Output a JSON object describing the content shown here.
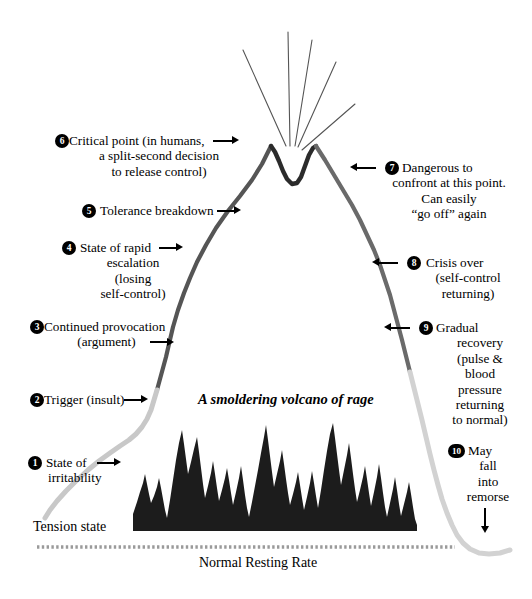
{
  "diagram": {
    "title_partial": "",
    "center_caption": "A smoldering volcano of rage",
    "baseline_label": "Normal Resting Rate",
    "tension_label": "Tension state",
    "colors": {
      "slope_upper": "#555555",
      "slope_lower": "#c8c8c8",
      "lava": "#1c1c1c",
      "baseline": "#9a9a9a",
      "eruption": "#555555",
      "text": "#000000",
      "badge": "#000000"
    },
    "stages": [
      {
        "number": "1",
        "side": "left",
        "lines": [
          "State of",
          "irritability"
        ],
        "arrow": "right"
      },
      {
        "number": "2",
        "side": "left",
        "lines": [
          "Trigger (insult)"
        ],
        "arrow": "right"
      },
      {
        "number": "3",
        "side": "left",
        "lines": [
          "Continued provocation",
          "(argument)"
        ],
        "arrow": "right"
      },
      {
        "number": "4",
        "side": "left",
        "lines": [
          "State of rapid",
          "escalation",
          "(losing",
          "self-control)"
        ],
        "arrow": "right"
      },
      {
        "number": "5",
        "side": "left",
        "lines": [
          "Tolerance breakdown"
        ],
        "arrow": "right"
      },
      {
        "number": "6",
        "side": "left",
        "lines": [
          "Critical point (in humans,",
          "a split-second decision",
          "to release control)"
        ],
        "arrow": "right"
      },
      {
        "number": "7",
        "side": "right",
        "lines": [
          "Dangerous to",
          "confront at this point.",
          "Can easily",
          "“go off” again"
        ],
        "arrow": "left"
      },
      {
        "number": "8",
        "side": "right",
        "lines": [
          "Crisis over",
          "(self-control",
          "returning)"
        ],
        "arrow": "left"
      },
      {
        "number": "9",
        "side": "right",
        "lines": [
          "Gradual",
          "recovery",
          "(pulse &",
          "blood",
          "pressure",
          "returning",
          "to normal)"
        ],
        "arrow": "left"
      },
      {
        "number": "10",
        "side": "right",
        "lines": [
          "May",
          "fall",
          "into",
          "remorse"
        ],
        "arrow": "down"
      }
    ]
  }
}
